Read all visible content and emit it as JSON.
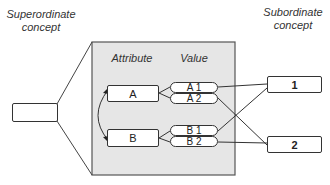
{
  "labels": {
    "superordinate": "Superordinate concept",
    "subordinate": "Subordinate concept",
    "attribute_header": "Attribute",
    "value_header": "Value"
  },
  "superordinate_box": {
    "text": ""
  },
  "attributes": [
    {
      "name": "A",
      "values": [
        "A 1",
        "A 2"
      ]
    },
    {
      "name": "B",
      "values": [
        "B 1",
        "B 2"
      ]
    }
  ],
  "subordinates": [
    "1",
    "2"
  ],
  "connections": [
    {
      "from": "A 1",
      "to": "1"
    },
    {
      "from": "A 2",
      "to": "2"
    },
    {
      "from": "B 1",
      "to": "1"
    },
    {
      "from": "B 2",
      "to": "2"
    }
  ],
  "colors": {
    "panel_fill": "#e4e4e4",
    "stroke": "#333333"
  }
}
